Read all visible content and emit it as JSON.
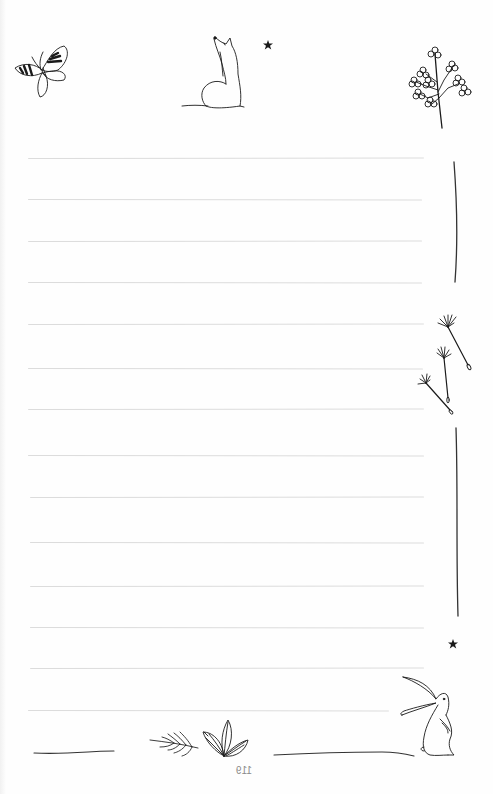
{
  "page": {
    "type": "lined-journal-page",
    "page_number": "119",
    "background_color": "#fefefe",
    "rule_color": "#dcdcdc",
    "ink_color": "#1a1a1a"
  },
  "ruled_lines": [
    {
      "y": 158,
      "x1": 28,
      "x2": 424
    },
    {
      "y": 199,
      "x1": 28,
      "x2": 422
    },
    {
      "y": 241,
      "x1": 28,
      "x2": 422
    },
    {
      "y": 282,
      "x1": 28,
      "x2": 422
    },
    {
      "y": 324,
      "x1": 28,
      "x2": 424
    },
    {
      "y": 368,
      "x1": 28,
      "x2": 423
    },
    {
      "y": 409,
      "x1": 28,
      "x2": 424
    },
    {
      "y": 455,
      "x1": 28,
      "x2": 424
    },
    {
      "y": 497,
      "x1": 30,
      "x2": 424
    },
    {
      "y": 542,
      "x1": 30,
      "x2": 424
    },
    {
      "y": 586,
      "x1": 30,
      "x2": 424
    },
    {
      "y": 627,
      "x1": 30,
      "x2": 424
    },
    {
      "y": 668,
      "x1": 30,
      "x2": 424
    },
    {
      "y": 710,
      "x1": 28,
      "x2": 389
    }
  ],
  "illustrations": {
    "top": [
      "butterfly",
      "fox-looking-up",
      "star",
      "flower-tree"
    ],
    "right_margin": [
      "vertical-stroke",
      "dandelion-seeds",
      "vertical-stroke",
      "star",
      "rabbit"
    ],
    "bottom": [
      "ground-line",
      "fern-sprig",
      "leaf-cluster",
      "ground-line"
    ]
  }
}
